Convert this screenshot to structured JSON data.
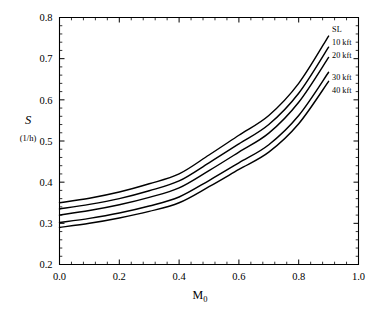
{
  "chart_data": {
    "type": "line",
    "title": "",
    "subtitle": "",
    "xlabel": "M",
    "xlabel_sub": "0",
    "ylabel": "S",
    "ylabel_unit": "(1/h)",
    "xlim": [
      0.0,
      1.0
    ],
    "ylim": [
      0.2,
      0.8
    ],
    "grid": false,
    "legend_position": "inline-right-end",
    "x_ticks": [
      "0.0",
      "0.2",
      "0.4",
      "0.6",
      "0.8",
      "1.0"
    ],
    "x_tick_values": [
      0.0,
      0.2,
      0.4,
      0.6,
      0.8,
      1.0
    ],
    "x_minor_count": 4,
    "y_ticks": [
      "0.2",
      "0.3",
      "0.4",
      "0.5",
      "0.6",
      "0.7",
      "0.8"
    ],
    "y_tick_values": [
      0.2,
      0.3,
      0.4,
      0.5,
      0.6,
      0.7,
      0.8
    ],
    "y_minor_count": 4,
    "x": [
      0.0,
      0.1,
      0.2,
      0.3,
      0.4,
      0.5,
      0.6,
      0.7,
      0.8,
      0.9
    ],
    "series": [
      {
        "name": "SL",
        "values": [
          0.35,
          0.361,
          0.376,
          0.396,
          0.42,
          0.466,
          0.514,
          0.562,
          0.64,
          0.755
        ]
      },
      {
        "name": "10 kft",
        "values": [
          0.335,
          0.346,
          0.36,
          0.379,
          0.403,
          0.447,
          0.493,
          0.54,
          0.616,
          0.728
        ]
      },
      {
        "name": "20 kft",
        "values": [
          0.32,
          0.331,
          0.345,
          0.363,
          0.386,
          0.428,
          0.473,
          0.519,
          0.594,
          0.703
        ]
      },
      {
        "name": "30 kft",
        "values": [
          0.302,
          0.312,
          0.325,
          0.342,
          0.364,
          0.404,
          0.447,
          0.491,
          0.562,
          0.667
        ]
      },
      {
        "name": "40 kft",
        "values": [
          0.29,
          0.3,
          0.313,
          0.329,
          0.35,
          0.389,
          0.431,
          0.473,
          0.542,
          0.645
        ]
      }
    ]
  },
  "figure": {
    "axis_color": "#000000",
    "curve_color": "#000000",
    "background": "#ffffff"
  }
}
